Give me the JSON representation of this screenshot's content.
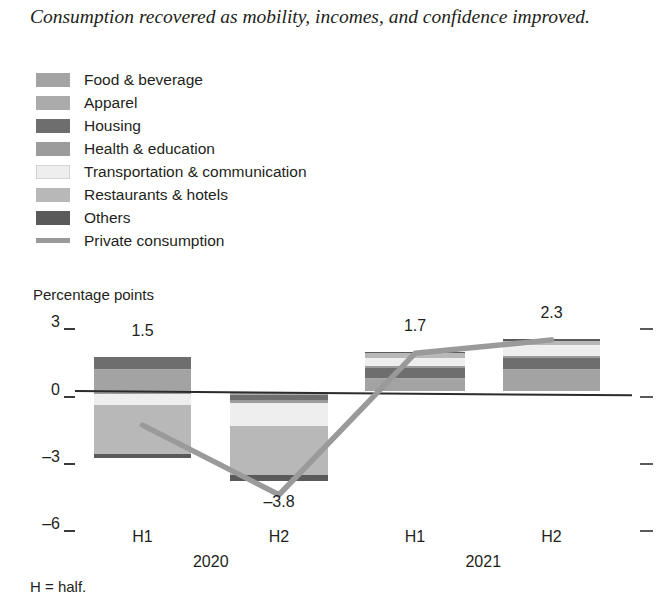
{
  "title": "Consumption recovered as mobility, incomes, and confidence improved.",
  "axis_title": "Percentage points",
  "footnote": "H = half.",
  "legend": {
    "items": [
      {
        "label": "Food & beverage",
        "color": "#a3a3a3",
        "type": "swatch"
      },
      {
        "label": "Apparel",
        "color": "#ababab",
        "type": "swatch"
      },
      {
        "label": "Housing",
        "color": "#6e6e6e",
        "type": "swatch"
      },
      {
        "label": "Health & education",
        "color": "#9c9c9c",
        "type": "swatch"
      },
      {
        "label": "Transportation & communication",
        "color": "#eeeeee",
        "type": "swatch"
      },
      {
        "label": "Restaurants & hotels",
        "color": "#b8b8b8",
        "type": "swatch"
      },
      {
        "label": "Others",
        "color": "#5a5a5a",
        "type": "swatch"
      },
      {
        "label": "Private consumption",
        "color": "#9a9a9a",
        "type": "line"
      }
    ]
  },
  "chart_data": {
    "type": "bar",
    "title": "Consumption recovered as mobility, incomes, and confidence improved.",
    "xlabel": "",
    "ylabel": "Percentage points",
    "ylim": [
      -6,
      3
    ],
    "yticks": [
      3,
      0,
      -3,
      -6
    ],
    "grid": false,
    "legend_position": "top-left",
    "stacked": true,
    "categories": [
      "H1",
      "H2",
      "H1",
      "H2"
    ],
    "groups": [
      "2020",
      "2020",
      "2021",
      "2021"
    ],
    "year_labels": [
      "2020",
      "2021"
    ],
    "series": [
      {
        "name": "Food & beverage",
        "color": "#a3a3a3",
        "values": [
          0.95,
          -0.1,
          0.55,
          0.95
        ]
      },
      {
        "name": "Apparel",
        "color": "#ababab",
        "values": [
          0.05,
          -0.05,
          0.05,
          0.05
        ]
      },
      {
        "name": "Housing",
        "color": "#6e6e6e",
        "values": [
          0.55,
          -0.25,
          0.45,
          0.5
        ]
      },
      {
        "name": "Health & education",
        "color": "#9c9c9c",
        "values": [
          -0.1,
          -0.1,
          0.1,
          0.1
        ]
      },
      {
        "name": "Transportation & communication",
        "color": "#eeeeee",
        "values": [
          -0.5,
          -1.05,
          0.35,
          0.45
        ]
      },
      {
        "name": "Restaurants & hotels",
        "color": "#b8b8b8",
        "values": [
          -2.2,
          -2.15,
          0.2,
          0.2
        ]
      },
      {
        "name": "Others",
        "color": "#5a5a5a",
        "values": [
          -0.15,
          -0.3,
          0.05,
          0.1
        ]
      }
    ],
    "totals": [
      1.5,
      -3.8,
      1.7,
      2.3
    ],
    "total_labels": [
      "1.5",
      "-3.8",
      "1.7",
      "2.3"
    ],
    "line_series": {
      "name": "Private consumption",
      "color": "#9a9a9a",
      "values": [
        -1.5,
        -4.6,
        1.7,
        2.3
      ]
    }
  }
}
